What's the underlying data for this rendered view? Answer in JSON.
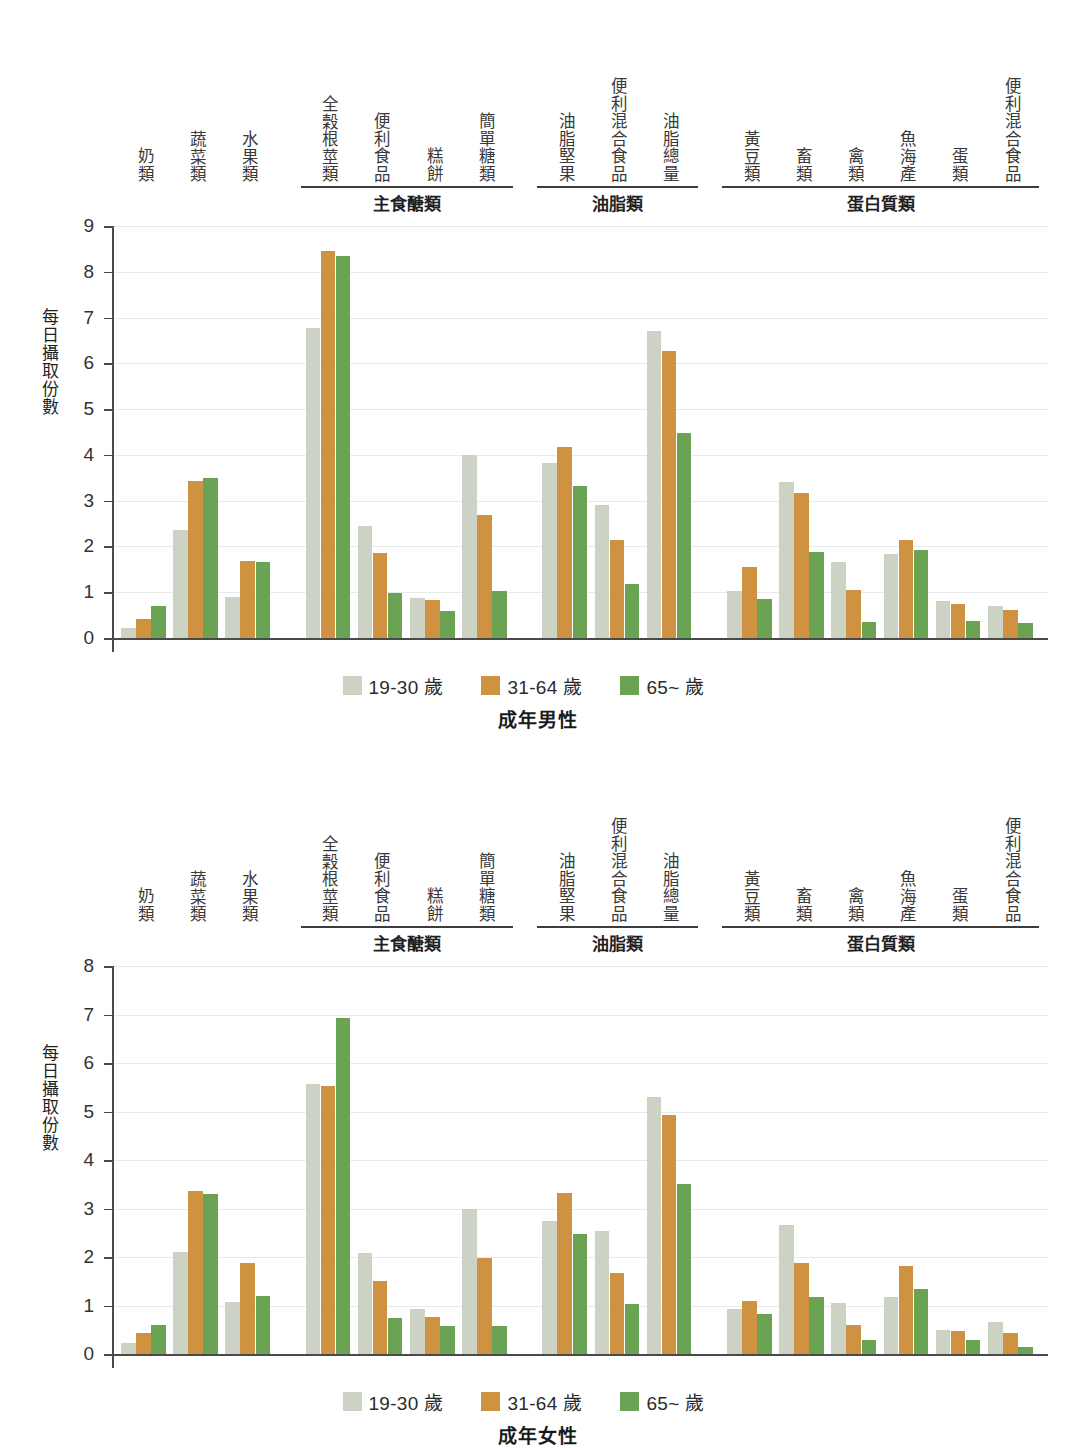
{
  "colors": {
    "series1": "#ccd2c4",
    "series2": "#cf9240",
    "series3": "#6ba355",
    "axis": "#4a4a4a",
    "grid": "#e8eaea",
    "text": "#2b2b2b"
  },
  "legend": {
    "items": [
      {
        "label": "19-30 歲",
        "color_key": "series1"
      },
      {
        "label": "31-64 歲",
        "color_key": "series2"
      },
      {
        "label": "65~ 歲",
        "color_key": "series3"
      }
    ]
  },
  "axis": {
    "ylabel": "每日攝取份數"
  },
  "group_headers": [
    {
      "label": "主食醣類"
    },
    {
      "label": "油脂類"
    },
    {
      "label": "蛋白質類"
    }
  ],
  "category_labels": [
    "奶類",
    "蔬菜類",
    "水果類",
    "全穀根莖類",
    "便利食品",
    "糕餅",
    "簡單糖類",
    "油脂堅果",
    "便利混合食品",
    "油脂總量",
    "黃豆類",
    "畜類",
    "禽類",
    "魚海產",
    "蛋類",
    "便利混合食品"
  ],
  "chart_data": [
    {
      "type": "bar",
      "title": "成年男性",
      "xlabel": "",
      "ylabel": "每日攝取份數",
      "ylim": [
        0,
        9
      ],
      "yticks": [
        0,
        1,
        2,
        3,
        4,
        5,
        6,
        7,
        8,
        9
      ],
      "grid": true,
      "legend_position": "bottom",
      "categories": [
        "奶類",
        "蔬菜類",
        "水果類",
        "全穀根莖類",
        "便利食品",
        "糕餅",
        "簡單糖類",
        "油脂堅果",
        "便利混合食品",
        "油脂總量",
        "黃豆類",
        "畜類",
        "禽類",
        "魚海產",
        "蛋類",
        "便利混合食品"
      ],
      "series": [
        {
          "name": "19-30 歲",
          "values": [
            0.22,
            2.35,
            0.9,
            6.78,
            2.45,
            0.88,
            4.0,
            3.82,
            2.9,
            6.7,
            1.03,
            3.4,
            1.65,
            1.83,
            0.8,
            0.7
          ]
        },
        {
          "name": "31-64 歲",
          "values": [
            0.42,
            3.43,
            1.68,
            8.45,
            1.85,
            0.82,
            2.68,
            4.17,
            2.15,
            6.28,
            1.55,
            3.17,
            1.05,
            2.15,
            0.75,
            0.62
          ]
        },
        {
          "name": "65~ 歲",
          "values": [
            0.7,
            3.5,
            1.65,
            8.35,
            0.98,
            0.58,
            1.02,
            3.32,
            1.18,
            4.48,
            0.85,
            1.87,
            0.35,
            1.93,
            0.38,
            0.32
          ]
        }
      ]
    },
    {
      "type": "bar",
      "title": "成年女性",
      "xlabel": "",
      "ylabel": "每日攝取份數",
      "ylim": [
        0,
        8
      ],
      "yticks": [
        0,
        1,
        2,
        3,
        4,
        5,
        6,
        7,
        8
      ],
      "grid": true,
      "legend_position": "bottom",
      "categories": [
        "奶類",
        "蔬菜類",
        "水果類",
        "全穀根莖類",
        "便利食品",
        "糕餅",
        "簡單糖類",
        "油脂堅果",
        "便利混合食品",
        "油脂總量",
        "黃豆類",
        "畜類",
        "禽類",
        "魚海產",
        "蛋類",
        "便利混合食品"
      ],
      "series": [
        {
          "name": "19-30 歲",
          "values": [
            0.23,
            2.1,
            1.07,
            5.57,
            2.08,
            0.92,
            3.0,
            2.75,
            2.53,
            5.3,
            0.92,
            2.65,
            1.05,
            1.18,
            0.5,
            0.65
          ]
        },
        {
          "name": "31-64 歲",
          "values": [
            0.43,
            3.37,
            1.88,
            5.52,
            1.5,
            0.77,
            1.98,
            3.32,
            1.67,
            4.93,
            1.1,
            1.87,
            0.6,
            1.82,
            0.47,
            0.43
          ]
        },
        {
          "name": "65~ 歲",
          "values": [
            0.6,
            3.3,
            1.2,
            6.93,
            0.75,
            0.57,
            0.58,
            2.47,
            1.03,
            3.5,
            0.83,
            1.18,
            0.28,
            1.35,
            0.28,
            0.15
          ]
        }
      ]
    }
  ]
}
